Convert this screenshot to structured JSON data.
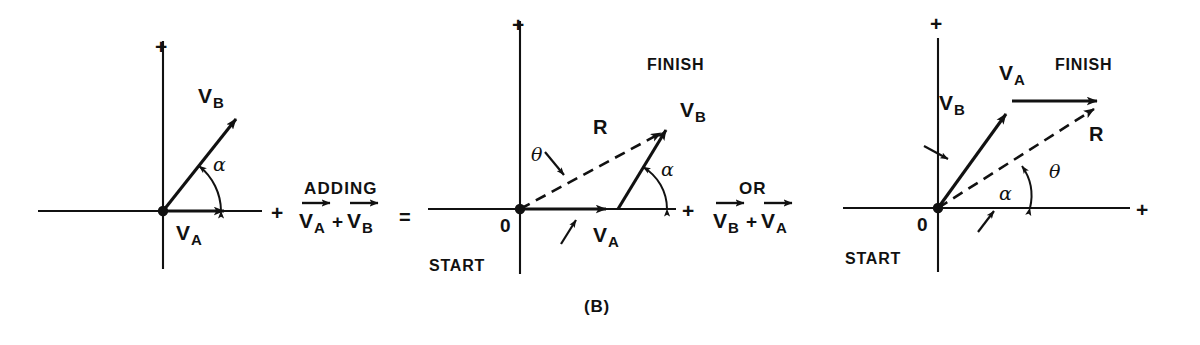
{
  "figure": {
    "caption": "(B)",
    "background_color": "#ffffff",
    "ink_color": "#111111"
  },
  "axis_labels": {
    "plus": "+",
    "origin": "0"
  },
  "markers": {
    "start": "START",
    "finish": "FINISH"
  },
  "vectors": {
    "v_a_letter": "V",
    "v_a_sub": "A",
    "v_b_letter": "V",
    "v_b_sub": "B",
    "resultant": "R"
  },
  "angles": {
    "alpha": "α",
    "theta": "θ"
  },
  "operators": {
    "adding": "ADDING",
    "or": "OR",
    "plus": "+",
    "equals": "="
  },
  "panels": [
    {
      "id": "panel-a",
      "name": "component-vectors",
      "origin": {
        "x": 163,
        "y": 211
      },
      "x_axis": {
        "x1": 38,
        "x2": 262,
        "y": 211
      },
      "y_axis": {
        "x": 163,
        "y1": 41,
        "y2": 269
      },
      "labels": {
        "plus_x": {
          "x": 271,
          "y": 202
        },
        "plus_y": {
          "x": 155,
          "y": 36
        },
        "v_a": {
          "x": 176,
          "y": 222
        },
        "v_b": {
          "x": 198,
          "y": 85
        },
        "alpha": {
          "x": 213,
          "y": 155
        }
      },
      "arrows": [
        {
          "name": "v-a-arrow",
          "x1": 163,
          "y1": 211,
          "x2": 231,
          "y2": 211,
          "style": "solid"
        },
        {
          "name": "v-b-arrow",
          "x1": 163,
          "y1": 211,
          "x2": 244,
          "y2": 109,
          "style": "solid"
        }
      ],
      "angle_arc": {
        "cx": 163,
        "cy": 211,
        "r": 58,
        "from_deg": 0,
        "to_deg": 51.5
      }
    },
    {
      "id": "panel-b",
      "name": "head-to-tail-va-then-vb",
      "origin": {
        "x": 520,
        "y": 209
      },
      "x_axis": {
        "x1": 428,
        "x2": 676,
        "y": 209
      },
      "y_axis": {
        "x": 520,
        "y1": 21,
        "y2": 274
      },
      "labels": {
        "plus_x": {
          "x": 682,
          "y": 200
        },
        "plus_y": {
          "x": 512,
          "y": 16
        },
        "origin": {
          "x": 501,
          "y": 218
        },
        "start": {
          "x": 430,
          "y": 258
        },
        "finish": {
          "x": 648,
          "y": 59
        },
        "v_a": {
          "x": 594,
          "y": 224
        },
        "v_b": {
          "x": 681,
          "y": 99
        },
        "r": {
          "x": 593,
          "y": 118
        },
        "alpha": {
          "x": 661,
          "y": 161
        },
        "theta": {
          "x": 532,
          "y": 147
        }
      },
      "arrows": [
        {
          "name": "v-a-arrow",
          "x1": 520,
          "y1": 209,
          "x2": 613,
          "y2": 209,
          "style": "solid"
        },
        {
          "name": "v-b-arrow",
          "x1": 618,
          "y1": 209,
          "x2": 672,
          "y2": 120,
          "style": "solid"
        },
        {
          "name": "resultant-arrow",
          "x1": 520,
          "y1": 209,
          "x2": 669,
          "y2": 124,
          "style": "dashed"
        }
      ],
      "angle_arc": {
        "cx": 618,
        "cy": 209,
        "r": 49,
        "from_deg": 0,
        "to_deg": 58.7
      },
      "leaders": [
        {
          "name": "v-a-leader",
          "x1": 561,
          "y1": 244,
          "x2": 578,
          "y2": 218
        },
        {
          "name": "theta-leader",
          "x1": 545,
          "y1": 153,
          "x2": 566,
          "y2": 178
        }
      ]
    },
    {
      "id": "panel-c",
      "name": "head-to-tail-vb-then-va",
      "origin": {
        "x": 938,
        "y": 208
      },
      "x_axis": {
        "x1": 843,
        "x2": 1130,
        "y": 208
      },
      "y_axis": {
        "x": 938,
        "y1": 38,
        "y2": 272
      },
      "labels": {
        "plus_x": {
          "x": 1136,
          "y": 199
        },
        "plus_y": {
          "x": 930,
          "y": 15
        },
        "origin": {
          "x": 918,
          "y": 217
        },
        "start": {
          "x": 845,
          "y": 252
        },
        "finish": {
          "x": 1055,
          "y": 58
        },
        "v_a": {
          "x": 1000,
          "y": 64
        },
        "v_b": {
          "x": 940,
          "y": 93
        },
        "r": {
          "x": 1089,
          "y": 125
        },
        "alpha": {
          "x": 1000,
          "y": 185
        },
        "theta": {
          "x": 1049,
          "y": 163
        }
      },
      "arrows": [
        {
          "name": "v-b-arrow",
          "x1": 938,
          "y1": 208,
          "x2": 1012,
          "y2": 105,
          "style": "solid"
        },
        {
          "name": "v-a-arrow",
          "x1": 1012,
          "y1": 101,
          "x2": 1105,
          "y2": 101,
          "style": "solid"
        },
        {
          "name": "resultant-arrow",
          "x1": 938,
          "y1": 208,
          "x2": 1103,
          "y2": 103,
          "style": "dashed"
        }
      ],
      "angle_arc": {
        "cx": 1042,
        "cy": 208,
        "r": 52,
        "from_deg": 0,
        "to_deg": 32.5
      },
      "leaders": [
        {
          "name": "v-b-leader",
          "x1": 928,
          "y1": 147,
          "x2": 952,
          "y2": 160
        },
        {
          "name": "alpha-leader",
          "x1": 980,
          "y1": 232,
          "x2": 996,
          "y2": 212
        }
      ]
    }
  ],
  "connectors": [
    {
      "id": "connector-adding",
      "name": "adding-operation",
      "word": "ADDING",
      "word_pos": {
        "x": 304,
        "y": 186
      },
      "expression": "V_A + V_B",
      "first_term_sub": "A",
      "second_term_sub": "B",
      "expr_pos": {
        "x": 300,
        "y": 218
      },
      "equals_pos": {
        "x": 401,
        "y": 212
      }
    },
    {
      "id": "connector-or",
      "name": "or-operation",
      "word": "OR",
      "word_pos": {
        "x": 740,
        "y": 186
      },
      "expression": "V_B + V_A",
      "first_term_sub": "B",
      "second_term_sub": "A",
      "expr_pos": {
        "x": 713,
        "y": 218
      },
      "equals_pos": null
    }
  ]
}
